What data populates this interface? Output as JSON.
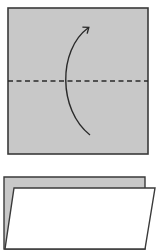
{
  "diagram": {
    "step1": {
      "paper_color": "#c8c8c8",
      "edge_color": "#3a3a3a",
      "fold_line": "dashed horizontal valley fold at middle",
      "arrow": "curved arrow from bottom to top indicating fold up"
    },
    "step2": {
      "back_layer_color": "#c8c8c8",
      "front_layer_color": "#ffffff",
      "result": "folded in half, white side showing in front"
    }
  }
}
